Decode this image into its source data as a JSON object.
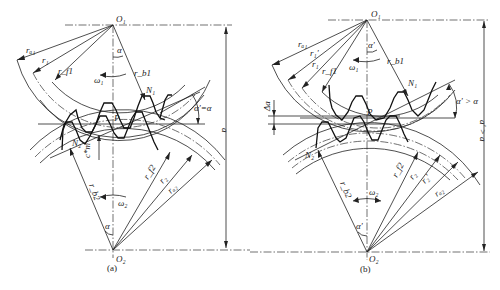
{
  "figure": {
    "type": "gear meshing diagram",
    "panels": [
      {
        "id": "a",
        "caption": "(a)",
        "labels": {
          "O1": "O₁",
          "O2": "O₂",
          "P": "P",
          "N1": "N₁",
          "N2": "N₂",
          "ra1": "rₐ₁",
          "r1": "r₁",
          "rf1": "r_f1",
          "rb1": "r_b1",
          "rb2": "r_b2",
          "rf2": "r_f2",
          "r2": "r₂",
          "ra2": "rₐ₂",
          "omega1": "ω₁",
          "omega2": "ω₂",
          "alpha_top": "α",
          "alpha_bottom": "α",
          "pressure_angle": "α'=α",
          "clearance": "c*m",
          "center_distance": "a"
        }
      },
      {
        "id": "b",
        "caption": "(b)",
        "labels": {
          "O1": "O₁",
          "O2": "O₂",
          "P": "P",
          "N1": "N₁",
          "N2": "N₂",
          "ra1": "rₐ₁",
          "r1p": "r₁'",
          "r1": "r₁",
          "rf1": "r_f1",
          "rb1": "r_b1",
          "rb2": "r_b2",
          "rf2": "r_f2",
          "r2": "r₂",
          "r2p": "r₂'",
          "ra2": "rₐ₂",
          "omega1": "ω₁",
          "omega2": "ω₂",
          "alpha_top": "α'",
          "alpha_bottom": "α'",
          "pressure_angle": "α' > α",
          "delta_a": "Δa",
          "center_distance": "a' > a"
        }
      }
    ]
  }
}
